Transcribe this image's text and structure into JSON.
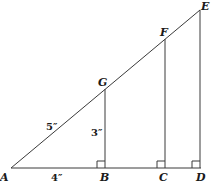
{
  "diagram": {
    "type": "similar-right-triangles",
    "points": {
      "A": {
        "label": "A"
      },
      "B": {
        "label": "B"
      },
      "C": {
        "label": "C"
      },
      "D": {
        "label": "D"
      },
      "E": {
        "label": "E"
      },
      "F": {
        "label": "F"
      },
      "G": {
        "label": "G"
      }
    },
    "measurements": {
      "AG": "5″",
      "GB": "3″",
      "AB": "4″"
    },
    "right_angles": [
      "B",
      "C",
      "D"
    ],
    "segments": [
      "AD",
      "AE",
      "GB",
      "FC",
      "ED"
    ]
  }
}
